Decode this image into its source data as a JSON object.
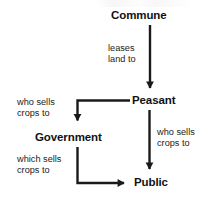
{
  "diagram": {
    "type": "flowchart",
    "background_color": "#ffffff",
    "line_color": "#1a1a1a",
    "text_color": "#111111",
    "nodes": [
      {
        "id": "commune",
        "label": "Commune"
      },
      {
        "id": "peasant",
        "label": "Peasant"
      },
      {
        "id": "government",
        "label": "Government"
      },
      {
        "id": "public",
        "label": "Public"
      }
    ],
    "edges": [
      {
        "id": "commune-to-peasant",
        "from": "Commune",
        "to": "Peasant",
        "label_line1": "leases",
        "label_line2": "land to",
        "shape": "straight-down",
        "arrowhead": "down"
      },
      {
        "id": "peasant-to-government",
        "from": "Peasant",
        "to": "Government",
        "label_line1": "who sells",
        "label_line2": "crops to",
        "shape": "elbow-left-then-down",
        "arrowhead": "down"
      },
      {
        "id": "peasant-to-public",
        "from": "Peasant",
        "to": "Public",
        "label_line1": "who sells",
        "label_line2": "crops to",
        "shape": "straight-down",
        "arrowhead": "down"
      },
      {
        "id": "government-to-public",
        "from": "Government",
        "to": "Public",
        "label_line1": "which sells",
        "label_line2": "crops to",
        "shape": "elbow-down-then-right",
        "arrowhead": "right"
      }
    ]
  }
}
